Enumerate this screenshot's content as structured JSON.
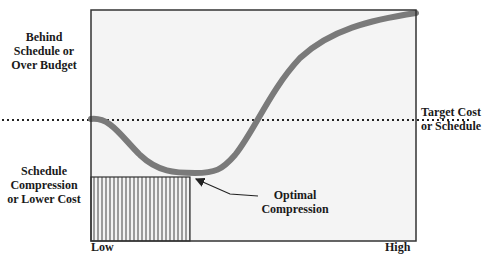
{
  "diagram": {
    "y_labels": {
      "top": [
        "Behind",
        "Schedule or",
        "Over Budget"
      ],
      "bottom": [
        "Schedule",
        "Compression",
        "or Lower Cost"
      ]
    },
    "x_labels": {
      "low": "Low",
      "high": "High"
    },
    "reference_line": {
      "label_line1": "Target Cost",
      "label_line2": "or Schedule",
      "style": "dotted"
    },
    "annotation": {
      "line1": "Optimal",
      "line2": "Compression"
    },
    "colors": {
      "curve": "#7a7a7a",
      "plot_background": "#f4f4f4",
      "frame": "#333333",
      "hatch": "#444444"
    },
    "curve": "U-shaped cost vs. compression curve: starts at target level at Low, dips to minimum at optimal compression, rises steeply toward High"
  }
}
